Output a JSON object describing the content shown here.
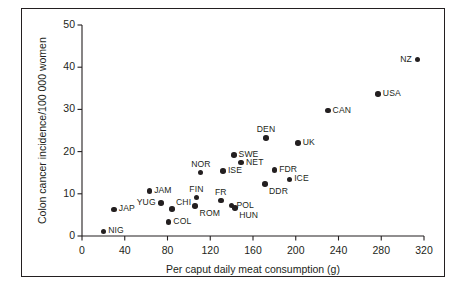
{
  "figure": {
    "background_color": "#ffffff",
    "frame_color": "#231f20",
    "marker_color": "#231f20"
  },
  "chart_data": {
    "type": "scatter",
    "title": "",
    "xlabel": "Per caput daily meat consumption (g)",
    "ylabel": "Colon cancer incidence/100 000 women",
    "xlim": [
      0,
      320
    ],
    "ylim": [
      0,
      50
    ],
    "xticks": [
      0,
      40,
      80,
      120,
      160,
      200,
      240,
      280,
      320
    ],
    "yticks": [
      0,
      10,
      20,
      30,
      40,
      50
    ],
    "xtick_labels": [
      "0",
      "40",
      "80",
      "120",
      "160",
      "200",
      "240",
      "280",
      "320"
    ],
    "ytick_labels": [
      "0",
      "10",
      "20",
      "30",
      "40",
      "50"
    ],
    "grid": false,
    "legend": false,
    "points": [
      {
        "label": "NIG",
        "x": 20,
        "y": 1.1,
        "label_pos": "right"
      },
      {
        "label": "JAP",
        "x": 30,
        "y": 6.3,
        "label_pos": "right"
      },
      {
        "label": "JAM",
        "x": 63,
        "y": 10.6,
        "label_pos": "right"
      },
      {
        "label": "YUG",
        "x": 74,
        "y": 7.8,
        "label_pos": "left"
      },
      {
        "label": "CHI",
        "x": 84,
        "y": 6.4,
        "label_pos": "upper-right"
      },
      {
        "label": "COL",
        "x": 81,
        "y": 3.3,
        "label_pos": "right"
      },
      {
        "label": "FIN",
        "x": 107,
        "y": 9.1,
        "label_pos": "above"
      },
      {
        "label": "ROM",
        "x": 106,
        "y": 7.1,
        "label_pos": "below-right"
      },
      {
        "label": "NOR",
        "x": 111,
        "y": 15.0,
        "label_pos": "above"
      },
      {
        "label": "FR",
        "x": 130,
        "y": 8.4,
        "label_pos": "above"
      },
      {
        "label": "ISE",
        "x": 132,
        "y": 15.4,
        "label_pos": "right"
      },
      {
        "label": "POL",
        "x": 140,
        "y": 7.2,
        "label_pos": "right"
      },
      {
        "label": "HUN",
        "x": 143,
        "y": 6.7,
        "label_pos": "below-right"
      },
      {
        "label": "SWE",
        "x": 142,
        "y": 19.2,
        "label_pos": "right"
      },
      {
        "label": "NET",
        "x": 149,
        "y": 17.4,
        "label_pos": "right"
      },
      {
        "label": "DEN",
        "x": 172,
        "y": 23.2,
        "label_pos": "above"
      },
      {
        "label": "DDR",
        "x": 171,
        "y": 12.3,
        "label_pos": "below-right"
      },
      {
        "label": "FDR",
        "x": 180,
        "y": 15.6,
        "label_pos": "right"
      },
      {
        "label": "ICE",
        "x": 194,
        "y": 13.4,
        "label_pos": "right"
      },
      {
        "label": "UK",
        "x": 202,
        "y": 22.1,
        "label_pos": "right"
      },
      {
        "label": "CAN",
        "x": 230,
        "y": 29.7,
        "label_pos": "right"
      },
      {
        "label": "USA",
        "x": 277,
        "y": 33.6,
        "label_pos": "right"
      },
      {
        "label": "NZ",
        "x": 314,
        "y": 41.8,
        "label_pos": "left"
      }
    ]
  }
}
